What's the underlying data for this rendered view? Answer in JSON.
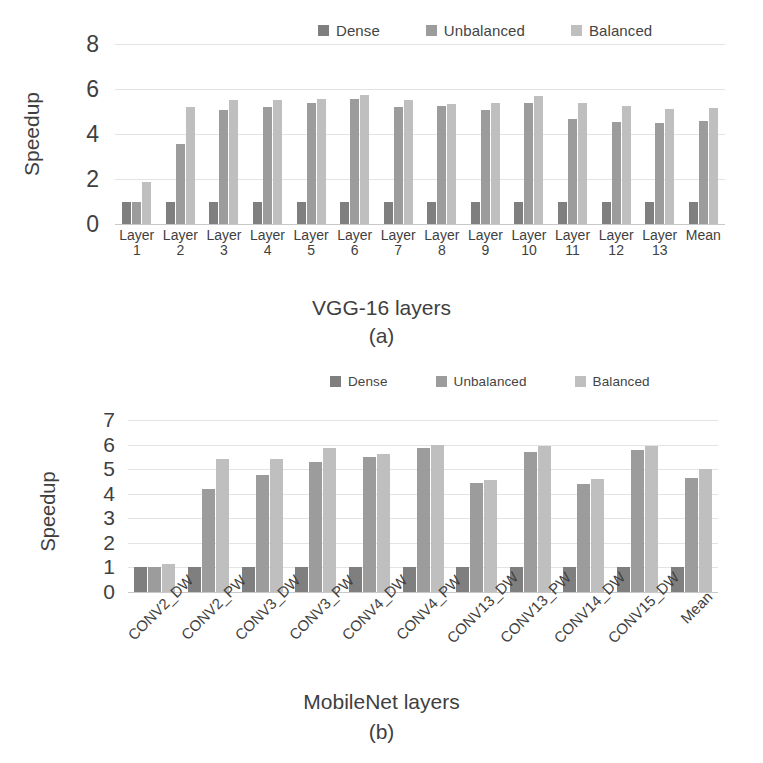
{
  "colors": {
    "dense": "#7f7f7f",
    "unbalanced": "#9c9c9c",
    "balanced": "#bfbfbf",
    "gridline": "#e3e3e3",
    "axis": "#c9c9c9",
    "text": "#3f3f3f",
    "background": "#ffffff"
  },
  "legend": {
    "dense_label": "Dense",
    "unbalanced_label": "Unbalanced",
    "balanced_label": "Balanced"
  },
  "figure_a": {
    "caption": "(a)",
    "xtitle": "VGG-16 layers",
    "ytitle": "Speedup",
    "yticks": [
      "8",
      "6",
      "4",
      "2",
      "0"
    ]
  },
  "figure_b": {
    "caption": "(b)",
    "xtitle": "MobileNet layers",
    "ytitle": "Speedup",
    "yticks": [
      "7",
      "6",
      "5",
      "4",
      "3",
      "2",
      "1",
      "0"
    ]
  },
  "chart_data": [
    {
      "type": "bar",
      "title": "(a) VGG-16 layers",
      "xlabel": "VGG-16 layers",
      "ylabel": "Speedup",
      "ylim": [
        0,
        8
      ],
      "ytick_values": [
        0,
        2,
        4,
        6,
        8
      ],
      "grid": true,
      "legend_position": "top",
      "categories": [
        "Layer 1",
        "Layer 2",
        "Layer 3",
        "Layer 4",
        "Layer 5",
        "Layer 6",
        "Layer 7",
        "Layer 8",
        "Layer 9",
        "Layer 10",
        "Layer 11",
        "Layer 12",
        "Layer 13",
        "Mean"
      ],
      "series": [
        {
          "name": "Dense",
          "color": "#7f7f7f",
          "values": [
            1.0,
            1.0,
            1.0,
            1.0,
            1.0,
            1.0,
            1.0,
            1.0,
            1.0,
            1.0,
            1.0,
            1.0,
            1.0,
            1.0
          ]
        },
        {
          "name": "Unbalanced",
          "color": "#9c9c9c",
          "values": [
            1.0,
            3.55,
            5.05,
            5.2,
            5.4,
            5.55,
            5.2,
            5.25,
            5.05,
            5.4,
            4.65,
            4.55,
            4.5,
            4.6
          ]
        },
        {
          "name": "Balanced",
          "color": "#bfbfbf",
          "values": [
            1.85,
            5.2,
            5.5,
            5.5,
            5.55,
            5.75,
            5.5,
            5.35,
            5.4,
            5.7,
            5.4,
            5.25,
            5.1,
            5.15
          ]
        }
      ]
    },
    {
      "type": "bar",
      "title": "(b) MobileNet layers",
      "xlabel": "MobileNet layers",
      "ylabel": "Speedup",
      "ylim": [
        0,
        7
      ],
      "ytick_values": [
        0,
        1,
        2,
        3,
        4,
        5,
        6,
        7
      ],
      "grid": true,
      "legend_position": "top",
      "categories": [
        "CONV2_DW",
        "CONV2_PW",
        "CONV3_DW",
        "CONV3_PW",
        "CONV4_DW",
        "CONV4_PW",
        "CONV13_DW",
        "CONV13_PW",
        "CONV14_DW",
        "CONV15_DW",
        "Mean"
      ],
      "series": [
        {
          "name": "Dense",
          "color": "#7f7f7f",
          "values": [
            1.0,
            1.0,
            1.0,
            1.0,
            1.0,
            1.0,
            1.0,
            1.0,
            1.0,
            1.0,
            1.0
          ]
        },
        {
          "name": "Unbalanced",
          "color": "#9c9c9c",
          "values": [
            1.0,
            4.2,
            4.75,
            5.3,
            5.5,
            5.85,
            4.45,
            5.7,
            4.4,
            5.8,
            4.65
          ]
        },
        {
          "name": "Balanced",
          "color": "#bfbfbf",
          "values": [
            1.15,
            5.4,
            5.4,
            5.85,
            5.6,
            6.0,
            4.55,
            5.95,
            4.6,
            5.95,
            5.0
          ]
        }
      ]
    }
  ]
}
